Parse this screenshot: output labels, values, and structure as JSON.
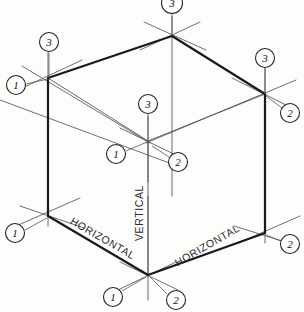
{
  "figure": {
    "background_color": "#fdfdfc",
    "ink_color": "#1a1a1a",
    "construction_line_color": "#555555"
  },
  "direction_labels": [
    {
      "id": "horizontal-left",
      "text": "HORIZONTAL",
      "x": 103,
      "y": 238,
      "rotate": 30
    },
    {
      "id": "vertical-center",
      "text": "VERTICAL",
      "x": 139,
      "y": 213,
      "rotate": -90
    },
    {
      "id": "horizontal-right",
      "text": "HORIZONTAL",
      "x": 207,
      "y": 245,
      "rotate": -30
    }
  ],
  "balloons": [
    {
      "id": "top-apex-3",
      "label": "3",
      "cx": 172,
      "cy": 3,
      "leader_x": 172,
      "leader_y": 16,
      "vertex": "top-apex"
    },
    {
      "id": "top-left-3",
      "label": "3",
      "cx": 49,
      "cy": 42,
      "leader_x": 49,
      "leader_y": 60,
      "vertex": "top-left"
    },
    {
      "id": "top-left-1",
      "label": "1",
      "cx": 16,
      "cy": 85,
      "leader_x": 34,
      "leader_y": 81,
      "vertex": "top-left"
    },
    {
      "id": "top-right-3",
      "label": "3",
      "cx": 265,
      "cy": 58,
      "leader_x": 265,
      "leader_y": 76,
      "vertex": "top-right"
    },
    {
      "id": "top-right-2",
      "label": "2",
      "cx": 290,
      "cy": 113,
      "leader_x": 276,
      "leader_y": 104,
      "vertex": "top-right"
    },
    {
      "id": "center-back-3",
      "label": "3",
      "cx": 148,
      "cy": 104,
      "leader_x": 148,
      "leader_y": 120,
      "vertex": "center-back"
    },
    {
      "id": "center-back-1",
      "label": "1",
      "cx": 116,
      "cy": 154,
      "leader_x": 136,
      "leader_y": 147,
      "vertex": "center-back"
    },
    {
      "id": "center-back-2",
      "label": "2",
      "cx": 178,
      "cy": 162,
      "leader_x": 160,
      "leader_y": 152,
      "vertex": "center-back"
    },
    {
      "id": "bottom-left-1",
      "label": "1",
      "cx": 15,
      "cy": 233,
      "leader_x": 33,
      "leader_y": 224,
      "vertex": "bottom-left"
    },
    {
      "id": "bottom-right-2",
      "label": "2",
      "cx": 290,
      "cy": 244,
      "leader_x": 276,
      "leader_y": 238,
      "vertex": "bottom-right"
    },
    {
      "id": "bottom-apex-1",
      "label": "1",
      "cx": 113,
      "cy": 297,
      "leader_x": 133,
      "leader_y": 286,
      "vertex": "bottom-apex"
    },
    {
      "id": "bottom-apex-2",
      "label": "2",
      "cx": 176,
      "cy": 300,
      "leader_x": 159,
      "leader_y": 286,
      "vertex": "bottom-apex"
    }
  ],
  "vertices": {
    "top_apex": {
      "x": 172,
      "y": 36
    },
    "top_left": {
      "x": 48,
      "y": 78
    },
    "top_right": {
      "x": 265,
      "y": 94
    },
    "center_back": {
      "x": 148,
      "y": 141
    },
    "bottom_left": {
      "x": 48,
      "y": 216
    },
    "bottom_right": {
      "x": 265,
      "y": 233
    },
    "bottom_apex": {
      "x": 148,
      "y": 275
    }
  },
  "legend": {
    "axis_1": "1",
    "axis_2": "2",
    "axis_3": "3",
    "note_horizontal": "HORIZONTAL",
    "note_vertical": "VERTICAL"
  }
}
